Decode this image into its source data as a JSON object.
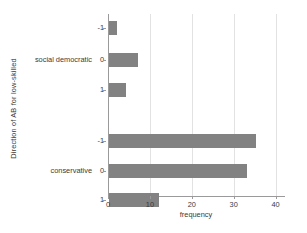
{
  "chart_data": {
    "type": "bar",
    "orientation": "horizontal",
    "title": "",
    "xlabel": "frequency",
    "ylabel": "Direction of AB for low-skilled",
    "xlim": [
      0,
      42
    ],
    "xticks": [
      0,
      10,
      20,
      30,
      40
    ],
    "xtick_labels": [
      "0",
      "10",
      "20",
      "30",
      "40"
    ],
    "grid": "vertical-only",
    "legend": "none",
    "bar_color": "#828282",
    "axis_color": "#9a9a9a",
    "grid_color": "#e2e2e2",
    "groups": [
      {
        "name": "social democratic",
        "categories": [
          "-1",
          "0",
          "1"
        ],
        "values": [
          2,
          7,
          4
        ]
      },
      {
        "name": "conservative",
        "categories": [
          "-1",
          "0",
          "1"
        ],
        "values": [
          35,
          33,
          12
        ]
      }
    ],
    "bars": [
      {
        "group": "social democratic",
        "category": "-1",
        "value": 2
      },
      {
        "group": "social democratic",
        "category": "0",
        "value": 7
      },
      {
        "group": "social democratic",
        "category": "1",
        "value": 4
      },
      {
        "group": "conservative",
        "category": "-1",
        "value": 35
      },
      {
        "group": "conservative",
        "category": "0",
        "value": 33
      },
      {
        "group": "conservative",
        "category": "1",
        "value": 12
      }
    ]
  }
}
